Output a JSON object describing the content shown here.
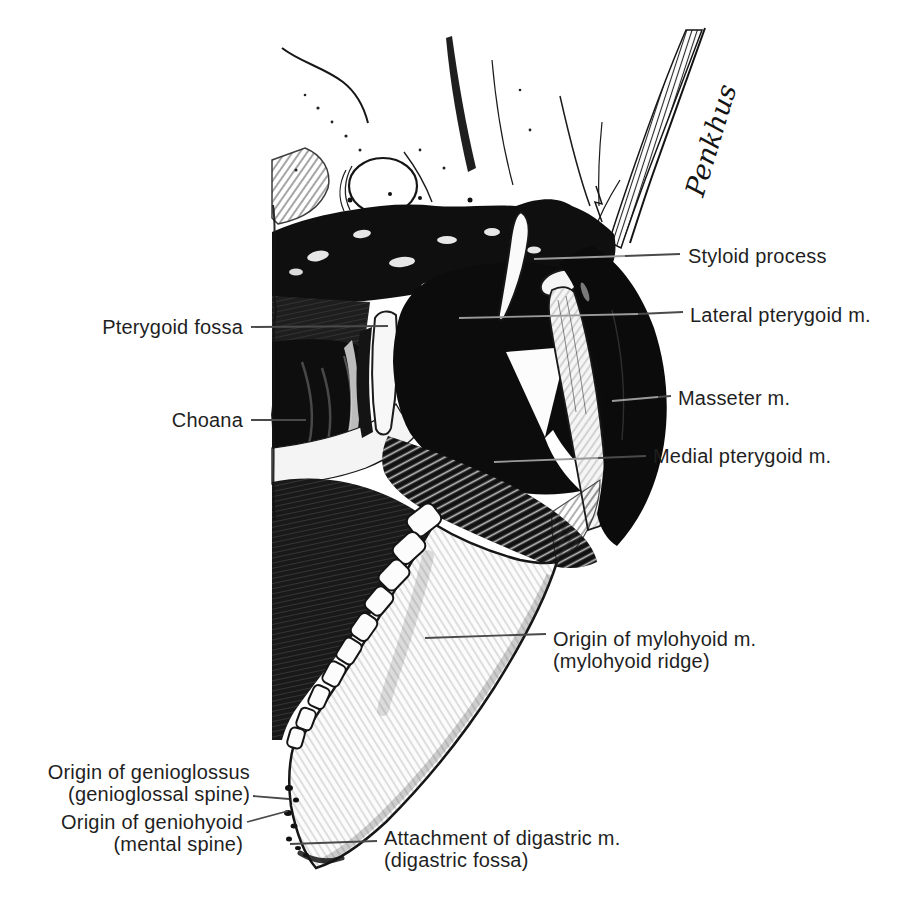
{
  "figure": {
    "background_color": "#ffffff",
    "ink_color": "#111111",
    "label_color": "#1f1f1f",
    "leader_color_on_white": "#4a4a4a",
    "leader_color_on_dark": "#9a9a9a",
    "signature": "Penkhus",
    "labels": {
      "pterygoid_fossa": "Pterygoid fossa",
      "choana": "Choana",
      "styloid_process": "Styloid process",
      "lateral_pterygoid": "Lateral pterygoid m.",
      "masseter": "Masseter m.",
      "medial_pterygoid": "Medial pterygoid m.",
      "mylohyoid": {
        "line1": "Origin of mylohyoid m.",
        "line2": "(mylohyoid ridge)"
      },
      "genioglossus": {
        "line1": "Origin of genioglossus",
        "line2": "(genioglossal spine)"
      },
      "geniohyoid": {
        "line1": "Origin of geniohyoid",
        "line2": "(mental spine)"
      },
      "digastric": {
        "line1": "Attachment of digastric m.",
        "line2": "(digastric fossa)"
      }
    }
  }
}
